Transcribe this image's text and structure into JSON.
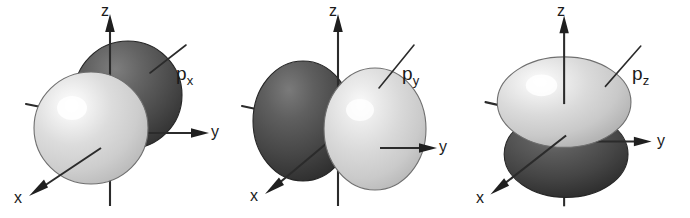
{
  "figure": {
    "background_color": "#ffffff",
    "lobe_colors": {
      "positive_lobe": "#d8d8d8",
      "negative_lobe": "#4a4a4a",
      "highlight": "#ffffff",
      "outline": "#3a3a3a"
    },
    "axis_color": "#2b2b2b"
  },
  "panels": [
    {
      "id": "px",
      "label_main": "p",
      "label_sub": "x",
      "orientation": "lobes along x axis, pointing toward and away from viewer",
      "axes": [
        {
          "name": "z",
          "label": "z",
          "direction": "up"
        },
        {
          "name": "y",
          "label": "y",
          "direction": "right"
        },
        {
          "name": "x",
          "label": "x",
          "direction": "down-left toward viewer"
        }
      ],
      "lobes": [
        {
          "sign": "back",
          "shade": "dark"
        },
        {
          "sign": "front",
          "shade": "light"
        }
      ]
    },
    {
      "id": "py",
      "label_main": "p",
      "label_sub": "y",
      "orientation": "lobes along y axis, side by side horizontally",
      "axes": [
        {
          "name": "z",
          "label": "z",
          "direction": "up"
        },
        {
          "name": "y",
          "label": "y",
          "direction": "right"
        },
        {
          "name": "x",
          "label": "x",
          "direction": "down-left toward viewer"
        }
      ],
      "lobes": [
        {
          "sign": "negative-y",
          "shade": "dark"
        },
        {
          "sign": "positive-y",
          "shade": "light"
        }
      ]
    },
    {
      "id": "pz",
      "label_main": "p",
      "label_sub": "z",
      "orientation": "lobes along z axis, stacked vertically",
      "axes": [
        {
          "name": "z",
          "label": "z",
          "direction": "up"
        },
        {
          "name": "y",
          "label": "y",
          "direction": "right"
        },
        {
          "name": "x",
          "label": "x",
          "direction": "down-left toward viewer"
        }
      ],
      "lobes": [
        {
          "sign": "positive-z",
          "shade": "light"
        },
        {
          "sign": "negative-z",
          "shade": "dark"
        }
      ]
    }
  ]
}
